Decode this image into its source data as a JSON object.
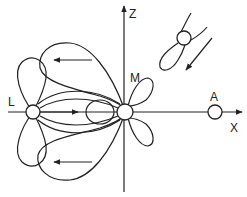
{
  "diagram": {
    "type": "orbital-overlap-schematic",
    "axes": {
      "z_label": "Z",
      "x_label": "X"
    },
    "atoms": [
      {
        "id": "L",
        "label": "L",
        "cx": 33,
        "cy": 112
      },
      {
        "id": "M",
        "label": "M",
        "cx": 125,
        "cy": 112
      },
      {
        "id": "A",
        "label": "A",
        "cx": 215,
        "cy": 112
      }
    ],
    "arrows": [
      {
        "name": "upper-lobe-arrow",
        "direction": "left"
      },
      {
        "name": "lower-lobe-arrow",
        "direction": "left"
      },
      {
        "name": "bond-arrow",
        "direction": "right"
      },
      {
        "name": "inset-arrow",
        "direction": "down-left"
      }
    ],
    "inset": {
      "description": "tilted atom with orbital lobe"
    },
    "colors": {
      "line": "#222222",
      "background": "#ffffff"
    }
  }
}
